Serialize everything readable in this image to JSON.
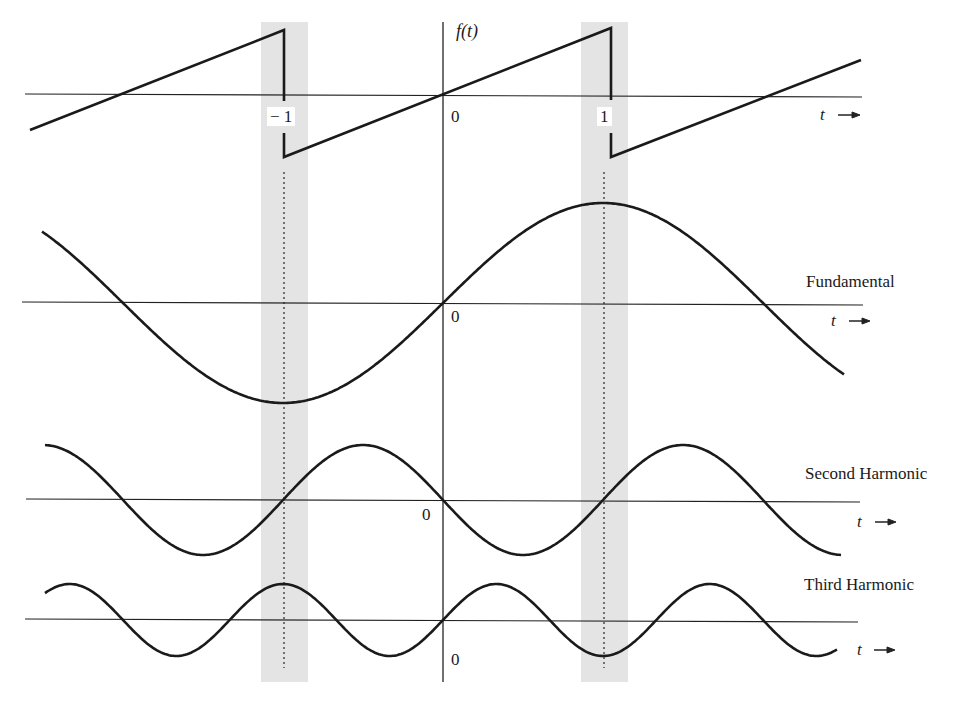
{
  "figure": {
    "axis_labels": {
      "function": "f(t)",
      "time": "t",
      "arrow": "→"
    },
    "ticks": {
      "neg_one": "− 1",
      "zero": "0",
      "one": "1"
    },
    "panels": [
      {
        "id": "sawtooth",
        "label": "",
        "zero_label": "0",
        "time_label": "t"
      },
      {
        "id": "fundamental",
        "label": "Fundamental",
        "zero_label": "0",
        "time_label": "t"
      },
      {
        "id": "second_harmonic",
        "label": "Second Harmonic",
        "zero_label": "0",
        "time_label": "t"
      },
      {
        "id": "third_harmonic",
        "label": "Third Harmonic",
        "zero_label": "0",
        "time_label": "t"
      }
    ],
    "colors": {
      "line": "#1a1a1a",
      "band": "#e4e4e4"
    }
  },
  "chart_data": {
    "type": "line",
    "title": "",
    "xlabel": "t",
    "ylabel": "f(t)",
    "x_ticks": [
      -1,
      0,
      1
    ],
    "shaded_regions": [
      [
        -1.07,
        -0.93
      ],
      [
        0.93,
        1.07
      ]
    ],
    "series": [
      {
        "name": "f(t) sawtooth",
        "formula": "f(t) = t on (-1, 1), period 2",
        "discontinuities_at": [
          -1,
          1
        ]
      },
      {
        "name": "Fundamental",
        "formula": "sin(pi t)",
        "relative_amplitude": 1.0
      },
      {
        "name": "Second Harmonic",
        "formula": "-sin(2 pi t)/2",
        "relative_amplitude": 0.55
      },
      {
        "name": "Third Harmonic",
        "formula": "sin(3 pi t)/3",
        "relative_amplitude": 0.36
      }
    ],
    "legend": [
      "Fundamental",
      "Second Harmonic",
      "Third Harmonic"
    ],
    "grid": false
  }
}
